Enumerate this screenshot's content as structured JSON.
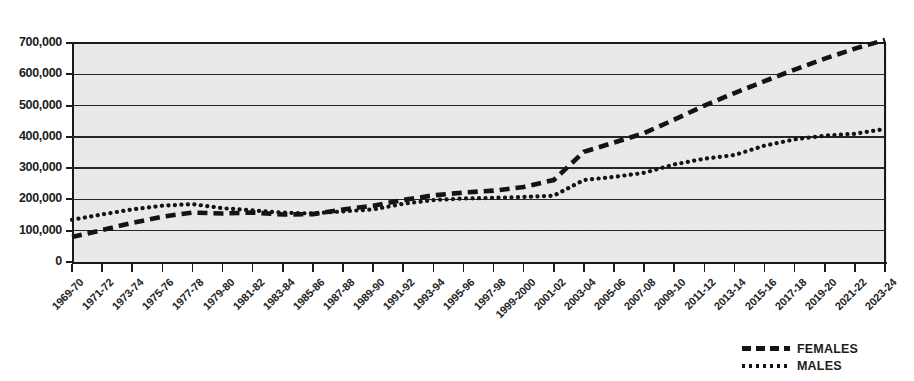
{
  "chart_title": "",
  "legend": {
    "position": "bottom-right",
    "entries": [
      {
        "label": "FEMALES",
        "style": "dashed"
      },
      {
        "label": "MALES",
        "style": "dotted"
      }
    ]
  },
  "axes": {
    "y_tick_labels": [
      "700,000",
      "600,000",
      "500,000",
      "400,000",
      "300,000",
      "200,000",
      "100,000",
      "0"
    ],
    "y_min": 0,
    "y_max": 700000,
    "y_step": 100000,
    "grid": "horizontal"
  },
  "chart_data": {
    "type": "line",
    "title": "",
    "xlabel": "",
    "ylabel": "",
    "ylim": [
      0,
      700000
    ],
    "ytick_values": [
      0,
      100000,
      200000,
      300000,
      400000,
      500000,
      600000,
      700000
    ],
    "grid": "horizontal-only",
    "legend_position": "bottom-right",
    "categories": [
      "1969-70",
      "1971-72",
      "1973-74",
      "1975-76",
      "1977-78",
      "1979-80",
      "1981-82",
      "1983-84",
      "1985-86",
      "1987-88",
      "1989-90",
      "1991-92",
      "1993-94",
      "1995-96",
      "1997-98",
      "1999-2000",
      "2001-02",
      "2003-04",
      "2005-06",
      "2007-08",
      "2009-10",
      "2011-12",
      "2013-14",
      "2015-16",
      "2017-18",
      "2019-20",
      "2021-22",
      "2023-24"
    ],
    "series": [
      {
        "name": "FEMALES",
        "style": "dashed",
        "color": "#141414",
        "values": [
          80000,
          102000,
          125000,
          145000,
          158000,
          155000,
          158000,
          152000,
          153000,
          168000,
          180000,
          198000,
          213000,
          222000,
          228000,
          240000,
          262000,
          352000,
          382000,
          412000,
          455000,
          500000,
          540000,
          578000,
          615000,
          650000,
          682000,
          710000
        ]
      },
      {
        "name": "MALES",
        "style": "dotted",
        "color": "#141414",
        "values": [
          135000,
          152000,
          168000,
          180000,
          185000,
          172000,
          165000,
          158000,
          155000,
          162000,
          168000,
          186000,
          198000,
          203000,
          205000,
          208000,
          212000,
          262000,
          272000,
          285000,
          312000,
          330000,
          342000,
          372000,
          392000,
          404000,
          410000,
          425000
        ]
      }
    ]
  }
}
